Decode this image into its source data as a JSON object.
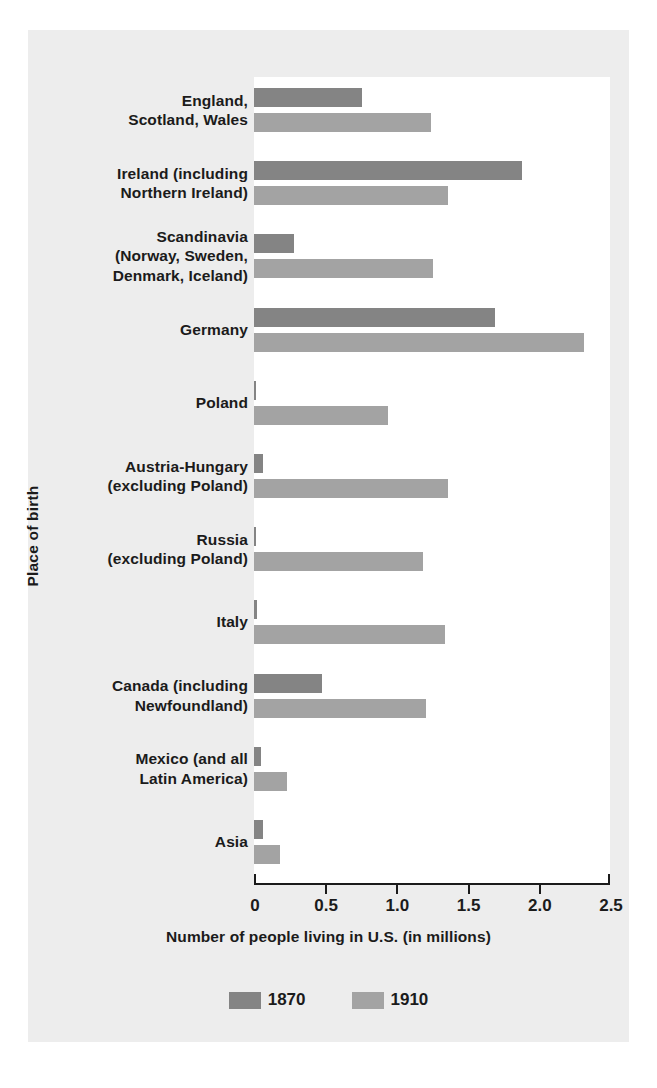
{
  "chart_data": {
    "type": "bar",
    "orientation": "horizontal",
    "title": "",
    "xlabel": "Number of people living in U.S. (in millions)",
    "ylabel": "Place of birth",
    "xlim": [
      0,
      2.5
    ],
    "xticks": [
      "0",
      "0.5",
      "1.0",
      "1.5",
      "2.0",
      "2.5"
    ],
    "xtick_values": [
      0,
      0.5,
      1.0,
      1.5,
      2.0,
      2.5
    ],
    "grid": false,
    "legend_position": "bottom",
    "colors": {
      "1870": "#848484",
      "1910": "#a3a3a3"
    },
    "categories": [
      "England,\nScotland, Wales",
      "Ireland (including\nNorthern Ireland)",
      "Scandinavia\n(Norway, Sweden,\nDenmark, Iceland)",
      "Germany",
      "Poland",
      "Austria-Hungary\n(excluding Poland)",
      "Russia\n(excluding Poland)",
      "Italy",
      "Canada (including\nNewfoundland)",
      "Mexico (and all\nLatin America)",
      "Asia"
    ],
    "series": [
      {
        "name": "1870",
        "values": [
          0.76,
          1.88,
          0.28,
          1.69,
          0.01,
          0.06,
          0.005,
          0.02,
          0.48,
          0.05,
          0.06
        ]
      },
      {
        "name": "1910",
        "values": [
          1.24,
          1.36,
          1.26,
          2.32,
          0.94,
          1.36,
          1.19,
          1.34,
          1.21,
          0.23,
          0.18
        ]
      }
    ]
  },
  "legend": {
    "items": [
      {
        "label": "1870",
        "color": "#848484"
      },
      {
        "label": "1910",
        "color": "#a3a3a3"
      }
    ]
  }
}
